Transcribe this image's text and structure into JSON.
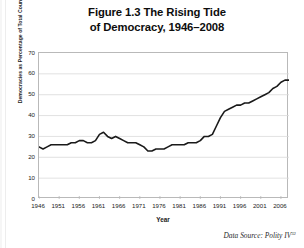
{
  "figure": {
    "title_line1": "Figure 1.3 The Rising Tide",
    "title_line2": "of Democracy, 1946–2008",
    "source_prefix": "Data Source: Polity IV",
    "source_superscript": "32"
  },
  "chart_data": {
    "type": "line",
    "title": "Figure 1.3 The Rising Tide of Democracy, 1946–2008",
    "xlabel": "Year",
    "ylabel": "Democracies as Percentage of Total Countries",
    "xlim": [
      1946,
      2008
    ],
    "ylim": [
      0,
      70
    ],
    "xticks": [
      1946,
      1951,
      1956,
      1961,
      1966,
      1971,
      1976,
      1981,
      1986,
      1991,
      1996,
      2001,
      2006
    ],
    "yticks": [
      0,
      10,
      20,
      30,
      40,
      50,
      60,
      70
    ],
    "grid": "horizontal",
    "legend": "none",
    "line_color": "#1a1a1a",
    "series": [
      {
        "name": "Democracies as Percentage of Total Countries",
        "x": [
          1946,
          1947,
          1948,
          1949,
          1950,
          1951,
          1952,
          1953,
          1954,
          1955,
          1956,
          1957,
          1958,
          1959,
          1960,
          1961,
          1962,
          1963,
          1964,
          1965,
          1966,
          1967,
          1968,
          1969,
          1970,
          1971,
          1972,
          1973,
          1974,
          1975,
          1976,
          1977,
          1978,
          1979,
          1980,
          1981,
          1982,
          1983,
          1984,
          1985,
          1986,
          1987,
          1988,
          1989,
          1990,
          1991,
          1992,
          1993,
          1994,
          1995,
          1996,
          1997,
          1998,
          1999,
          2000,
          2001,
          2002,
          2003,
          2004,
          2005,
          2006,
          2007,
          2008
        ],
        "values": [
          25,
          24,
          25,
          26,
          26,
          26,
          26,
          26,
          27,
          27,
          28,
          28,
          27,
          27,
          28,
          31,
          32,
          30,
          29,
          30,
          29,
          28,
          27,
          27,
          27,
          26,
          25,
          23,
          23,
          24,
          24,
          24,
          25,
          26,
          26,
          26,
          26,
          27,
          27,
          27,
          28,
          30,
          30,
          31,
          35,
          39,
          42,
          43,
          44,
          45,
          45,
          46,
          46,
          47,
          48,
          49,
          50,
          51,
          53,
          54,
          56,
          57,
          57
        ]
      }
    ]
  }
}
